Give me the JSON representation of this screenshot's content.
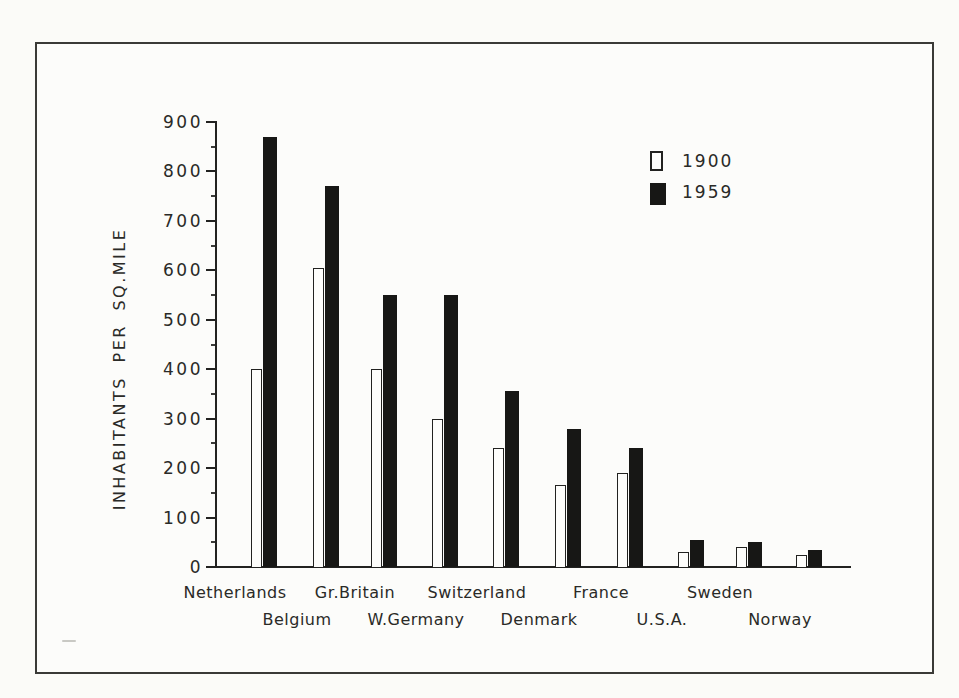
{
  "figure": {
    "paper_color": "#fbfbf8",
    "ink_color": "#222220",
    "bar_fill_color": "#171715",
    "frame": "thin dark rectangular border around entire figure"
  },
  "chart_data": {
    "type": "bar",
    "title": "",
    "xlabel": "",
    "ylabel": "INHABITANTS PER SQ.MILE",
    "ylim": [
      0,
      900
    ],
    "y_ticks": [
      0,
      100,
      200,
      300,
      400,
      500,
      600,
      700,
      800,
      900
    ],
    "y_minor_tick_step": 50,
    "grid": false,
    "legend_position": "upper right",
    "categories": [
      "Netherlands",
      "Belgium",
      "Gr.Britain",
      "W.Germany",
      "Switzerland",
      "Denmark",
      "France",
      "U.S.A.",
      "Sweden",
      "Norway"
    ],
    "series": [
      {
        "name": "1900",
        "style": "outline",
        "color": "#ffffff",
        "values": [
          400,
          605,
          400,
          300,
          240,
          165,
          190,
          30,
          40,
          25
        ]
      },
      {
        "name": "1959",
        "style": "filled",
        "color": "#171715",
        "values": [
          870,
          770,
          550,
          550,
          355,
          280,
          240,
          55,
          50,
          35
        ]
      }
    ]
  },
  "legend": {
    "items": [
      {
        "label": "1900",
        "swatch": "outline"
      },
      {
        "label": "1959",
        "swatch": "filled"
      }
    ]
  }
}
